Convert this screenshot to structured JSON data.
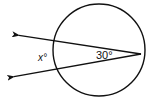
{
  "diagram": {
    "type": "circle-secants-angle",
    "circle": {
      "cx": 99,
      "cy": 50,
      "r": 46
    },
    "vertex": {
      "x": 141,
      "y": 54
    },
    "rays": [
      {
        "name": "upper-secant",
        "tip": {
          "x": 17,
          "y": 35
        }
      },
      {
        "name": "lower-secant",
        "tip": {
          "x": 12,
          "y": 77
        }
      }
    ],
    "labels": {
      "exterior_angle": "x°",
      "inscribed_angle": "30°"
    },
    "colors": {
      "stroke": "#111111",
      "background": "#ffffff"
    }
  }
}
